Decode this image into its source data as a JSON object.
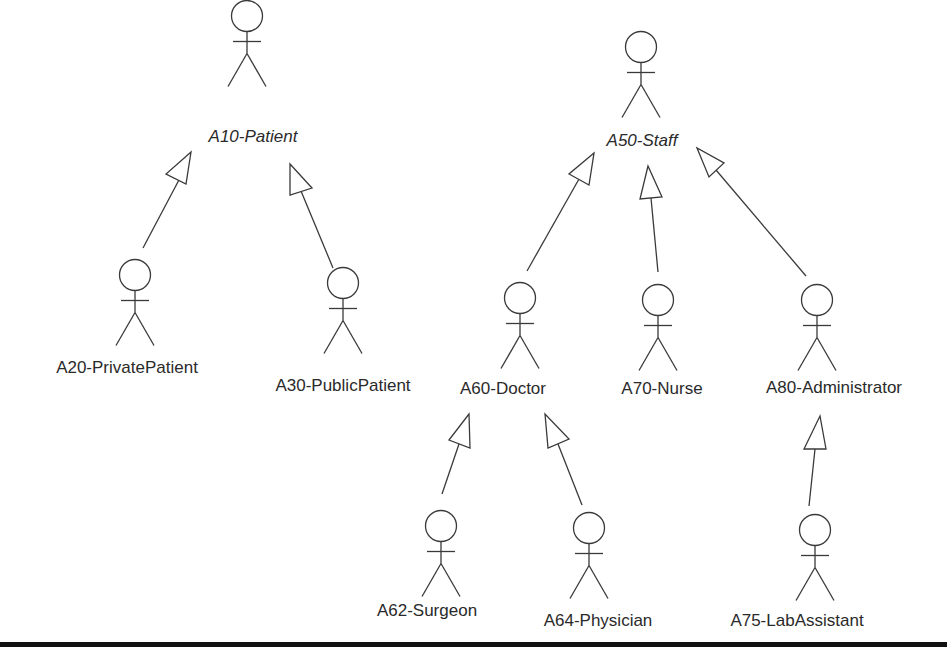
{
  "diagram": {
    "type": "UML use case actor generalization hierarchy",
    "colors": {
      "line": "#3a3a3a",
      "text": "#2a2a2a",
      "rule": "#111111",
      "background": "#ffffff"
    },
    "actors": [
      {
        "id": "A10",
        "label": "A10-Patient",
        "abstract": true,
        "head": [
          247,
          16
        ],
        "text": [
          253,
          142
        ]
      },
      {
        "id": "A20",
        "label": "A20-PrivatePatient",
        "abstract": false,
        "head": [
          135,
          275
        ],
        "text": [
          127,
          373
        ]
      },
      {
        "id": "A30",
        "label": "A30-PublicPatient",
        "abstract": false,
        "head": [
          343,
          283
        ],
        "text": [
          343,
          391
        ]
      },
      {
        "id": "A50",
        "label": "A50-Staff",
        "abstract": true,
        "head": [
          641,
          47
        ],
        "text": [
          642,
          146
        ]
      },
      {
        "id": "A60",
        "label": "A60-Doctor",
        "abstract": false,
        "head": [
          520,
          298
        ],
        "text": [
          503,
          394
        ]
      },
      {
        "id": "A70",
        "label": "A70-Nurse",
        "abstract": false,
        "head": [
          658,
          300
        ],
        "text": [
          662,
          394
        ]
      },
      {
        "id": "A80",
        "label": "A80-Administrator",
        "abstract": false,
        "head": [
          817,
          300
        ],
        "text": [
          834,
          393
        ]
      },
      {
        "id": "A62",
        "label": "A62-Surgeon",
        "abstract": false,
        "head": [
          441,
          526
        ],
        "text": [
          427,
          616
        ]
      },
      {
        "id": "A64",
        "label": "A64-Physician",
        "abstract": false,
        "head": [
          589,
          528
        ],
        "text": [
          598,
          626
        ]
      },
      {
        "id": "A75",
        "label": "A75-LabAssistant",
        "abstract": false,
        "head": [
          815,
          530
        ],
        "text": [
          797,
          626
        ]
      }
    ],
    "generalizations": [
      {
        "child": "A20",
        "parent": "A10",
        "from": [
          143,
          248
        ],
        "to": [
          180,
          178
        ],
        "tip": [
          191,
          152
        ],
        "base": [
          [
            166,
            174
          ],
          [
            186,
            184
          ]
        ]
      },
      {
        "child": "A30",
        "parent": "A10",
        "from": [
          333,
          268
        ],
        "to": [
          301,
          191
        ],
        "tip": [
          290,
          164
        ],
        "base": [
          [
            290,
            195
          ],
          [
            312,
            188
          ]
        ]
      },
      {
        "child": "A60",
        "parent": "A50",
        "from": [
          527,
          271
        ],
        "to": [
          579,
          179
        ],
        "tip": [
          594,
          153
        ],
        "base": [
          [
            569,
            174
          ],
          [
            589,
            185
          ]
        ]
      },
      {
        "child": "A70",
        "parent": "A50",
        "from": [
          658,
          272
        ],
        "to": [
          651,
          198
        ],
        "tip": [
          648,
          166
        ],
        "base": [
          [
            640,
            199
          ],
          [
            662,
            197
          ]
        ]
      },
      {
        "child": "A80",
        "parent": "A50",
        "from": [
          806,
          276
        ],
        "to": [
          716,
          170
        ],
        "tip": [
          697,
          148
        ],
        "base": [
          [
            709,
            177
          ],
          [
            724,
            163
          ]
        ]
      },
      {
        "child": "A62",
        "parent": "A60",
        "from": [
          442,
          494
        ],
        "to": [
          459,
          444
        ],
        "tip": [
          469,
          414
        ],
        "base": [
          [
            449,
            440
          ],
          [
            470,
            448
          ]
        ]
      },
      {
        "child": "A64",
        "parent": "A60",
        "from": [
          582,
          505
        ],
        "to": [
          558,
          444
        ],
        "tip": [
          545,
          414
        ],
        "base": [
          [
            548,
            448
          ],
          [
            569,
            439
          ]
        ]
      },
      {
        "child": "A75",
        "parent": "A80",
        "from": [
          809,
          506
        ],
        "to": [
          815,
          449
        ],
        "tip": [
          820,
          416
        ],
        "base": [
          [
            804,
            449
          ],
          [
            826,
            449
          ]
        ]
      }
    ],
    "bottom_rule": {
      "y": 642,
      "height": 5
    }
  }
}
